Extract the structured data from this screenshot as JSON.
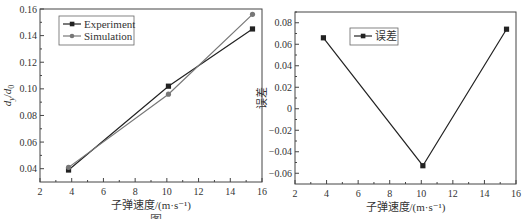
{
  "chart_data": [
    {
      "type": "line",
      "title": "",
      "xlabel": "子弹速度/(m·s⁻¹)",
      "ylabel": "d_y/d_0",
      "xlim": [
        2,
        16
      ],
      "ylim": [
        0.03,
        0.16
      ],
      "xticks": [
        2,
        4,
        6,
        8,
        10,
        12,
        14,
        16
      ],
      "yticks": [
        0.04,
        0.06,
        0.08,
        0.1,
        0.12,
        0.14,
        0.16
      ],
      "ytick_labels": [
        "0.04",
        "0.06",
        "0.08",
        "0.10",
        "0.12",
        "0.14",
        "0.16"
      ],
      "x": [
        3.8,
        10.1,
        15.4
      ],
      "series": [
        {
          "name": "Experiment",
          "marker": "square",
          "color": "#222222",
          "values": [
            0.039,
            0.102,
            0.145
          ]
        },
        {
          "name": "Simulation",
          "marker": "circle",
          "color": "#777777",
          "values": [
            0.041,
            0.096,
            0.156
          ]
        }
      ],
      "legend_position": "upper left",
      "grid": false
    },
    {
      "type": "line",
      "title": "",
      "xlabel": "子弹速度/(m·s⁻¹)",
      "ylabel": "误差",
      "xlim": [
        2,
        16
      ],
      "ylim": [
        -0.07,
        0.09
      ],
      "xticks": [
        2,
        4,
        6,
        8,
        10,
        12,
        14,
        16
      ],
      "yticks": [
        -0.06,
        -0.04,
        -0.02,
        0,
        0.02,
        0.04,
        0.06,
        0.08
      ],
      "ytick_labels": [
        "−0.06",
        "−0.04",
        "−0.02",
        "0",
        "0.02",
        "0.04",
        "0.06",
        "0.08"
      ],
      "x": [
        3.8,
        10.1,
        15.4
      ],
      "series": [
        {
          "name": "误差",
          "marker": "square",
          "color": "#222222",
          "values": [
            0.066,
            -0.053,
            0.074
          ]
        }
      ],
      "legend_position": "upper center",
      "grid": false
    }
  ],
  "caption": "图"
}
